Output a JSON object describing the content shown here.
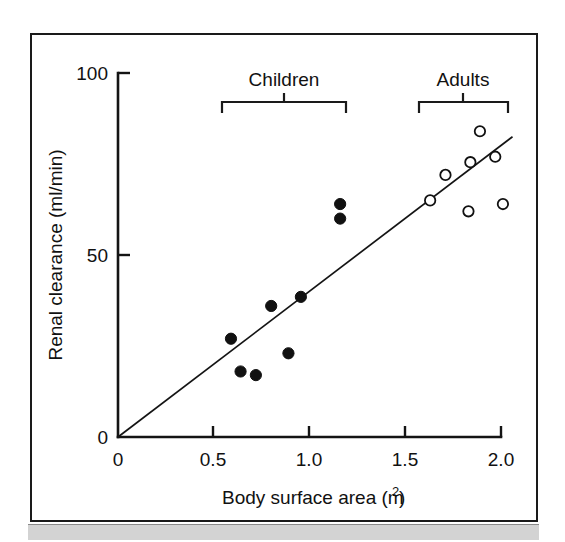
{
  "figure": {
    "background_color": "#ffffff",
    "frame_color": "#1a1a1a",
    "footer_bar_color": "#d3d3d3"
  },
  "chart_data": {
    "type": "scatter",
    "title": "",
    "xlabel": "Body surface area (m",
    "xlabel_superscript": "2",
    "xlabel_suffix": ")",
    "ylabel": "Renal clearance (ml/min)",
    "xlim": [
      0,
      2.1
    ],
    "ylim": [
      0,
      100
    ],
    "xticks": [
      0,
      0.5,
      1.0,
      1.5,
      2.0
    ],
    "xticklabels": [
      "0",
      "0.5",
      "1.0",
      "1.5",
      "2.0"
    ],
    "yticks": [
      0,
      50,
      100
    ],
    "yticklabels": [
      "0",
      "50",
      "100"
    ],
    "grid": false,
    "legend": "none",
    "marker_colors": {
      "children": "#111111",
      "adults": "#ffffff",
      "marker_edge": "#111111",
      "trendline": "#141414"
    },
    "series": [
      {
        "name": "Children",
        "marker": "filled-circle",
        "points": [
          {
            "x": 0.59,
            "y": 27.0
          },
          {
            "x": 0.64,
            "y": 18.0
          },
          {
            "x": 0.72,
            "y": 17.0
          },
          {
            "x": 0.8,
            "y": 36.0
          },
          {
            "x": 0.89,
            "y": 23.0
          },
          {
            "x": 0.955,
            "y": 38.5
          },
          {
            "x": 1.16,
            "y": 64.0
          },
          {
            "x": 1.16,
            "y": 60.0
          }
        ]
      },
      {
        "name": "Adults",
        "marker": "open-circle",
        "points": [
          {
            "x": 1.63,
            "y": 65.0
          },
          {
            "x": 1.71,
            "y": 72.0
          },
          {
            "x": 1.83,
            "y": 62.0
          },
          {
            "x": 1.84,
            "y": 75.5
          },
          {
            "x": 1.89,
            "y": 84.0
          },
          {
            "x": 1.97,
            "y": 77.0
          },
          {
            "x": 2.01,
            "y": 64.0
          }
        ]
      }
    ],
    "trendline": {
      "name": "regression-line",
      "x0": 0.0,
      "y0": 0.0,
      "x1": 2.06,
      "y1": 82.5
    },
    "annotations": [
      {
        "name": "children-bracket",
        "label": "Children",
        "x_start": 0.555,
        "x_end": 1.21,
        "label_y": 91.5,
        "bracket_y": 91.5
      },
      {
        "name": "adults-bracket",
        "label": "Adults",
        "x_start": 1.6,
        "x_end": 2.07,
        "label_y": 91.5,
        "bracket_y": 91.5
      }
    ]
  }
}
